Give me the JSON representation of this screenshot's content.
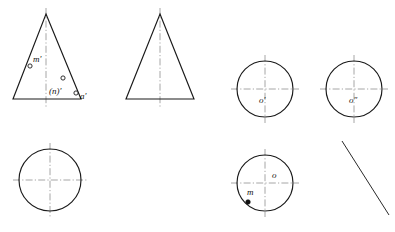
{
  "figure": {
    "canvas": {
      "width": 395,
      "height": 232
    },
    "colors": {
      "background": "#ffffff",
      "outline": "#1a1a1a",
      "centerline": "#8a8a8a",
      "point_fill_solid": "#111111",
      "point_fill_open": "#ffffff",
      "label_text": "#111111"
    }
  },
  "views": {
    "triangle_front": {
      "name": "cone front view with points",
      "apex": {
        "x": 46,
        "y": 14
      },
      "base_left": {
        "x": 13,
        "y": 99
      },
      "base_right": {
        "x": 81,
        "y": 99
      },
      "axis": {
        "x": 46,
        "y_top": 8,
        "y_bottom": 107
      },
      "points": [
        {
          "id": "m-prime",
          "label": "m'",
          "marker": "open",
          "x": 30,
          "y": 66,
          "label_x": 33,
          "label_y": 62
        },
        {
          "id": "n-prime",
          "label": "(n)'",
          "marker": "open",
          "x": 63,
          "y": 78,
          "label_x": 49,
          "label_y": 94
        },
        {
          "id": "a-prime",
          "label": "a'",
          "marker": "open",
          "x": 76,
          "y": 93,
          "label_x": 80,
          "label_y": 99
        }
      ]
    },
    "triangle_plain": {
      "name": "cone front view plain",
      "apex": {
        "x": 160,
        "y": 14
      },
      "base_left": {
        "x": 126,
        "y": 99
      },
      "base_right": {
        "x": 194,
        "y": 99
      },
      "axis": {
        "x": 160,
        "y_top": 8,
        "y_bottom": 107
      }
    },
    "circle_o_prime": {
      "name": "top view circle o prime",
      "center": {
        "x": 265,
        "y": 89
      },
      "radius": 28,
      "label": "o'",
      "label_x": 259,
      "label_y": 103,
      "centerline_h": {
        "x1": 231,
        "x2": 299,
        "y": 89
      },
      "centerline_v": {
        "y1": 55,
        "y2": 123,
        "x": 265
      }
    },
    "circle_o_double_prime": {
      "name": "side view circle o double prime",
      "center": {
        "x": 354,
        "y": 89
      },
      "radius": 28,
      "label": "o″",
      "label_x": 349,
      "label_y": 103,
      "centerline_h": {
        "x1": 320,
        "x2": 388,
        "y": 89
      },
      "centerline_v": {
        "y1": 55,
        "y2": 123,
        "x": 354
      }
    },
    "circle_blank": {
      "name": "bottom left circle unlabeled",
      "center": {
        "x": 50,
        "y": 180
      },
      "radius": 31,
      "centerline_h": {
        "x1": 13,
        "x2": 87,
        "y": 180
      },
      "centerline_v": {
        "y1": 143,
        "y2": 217,
        "x": 50
      }
    },
    "circle_o": {
      "name": "bottom middle circle with point m",
      "center": {
        "x": 265,
        "y": 183
      },
      "radius": 28,
      "centerline_h": {
        "x1": 231,
        "x2": 299,
        "y": 183
      },
      "centerline_v": {
        "y1": 149,
        "y2": 217,
        "x": 265
      },
      "labels": [
        {
          "id": "o-center",
          "label": "o",
          "label_x": 272,
          "label_y": 178
        },
        {
          "id": "m-point-label",
          "label": "m",
          "label_x": 247,
          "label_y": 195
        }
      ],
      "points": [
        {
          "id": "m-point",
          "label": "m",
          "marker": "solid",
          "x": 248,
          "y": 202
        }
      ]
    },
    "diagonal_line": {
      "name": "inclined reference line",
      "x1": 342,
      "y1": 141,
      "x2": 389,
      "y2": 215
    }
  }
}
